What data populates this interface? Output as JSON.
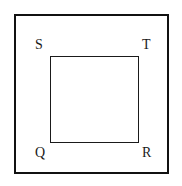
{
  "figure": {
    "type": "geometry-diagram",
    "background_color": "#ffffff",
    "stroke_color": "#111111",
    "outer_frame": {
      "name": "outer-rectangle",
      "x": 14,
      "y": 14,
      "width": 155,
      "height": 160,
      "stroke_width": 2
    },
    "inner_square": {
      "name": "square-QRTS",
      "x": 50,
      "y": 56,
      "width": 89,
      "height": 87,
      "stroke_width": 1.6
    },
    "vertices": [
      {
        "id": "S",
        "label": "S",
        "position": "top-left",
        "x": 35,
        "y": 38
      },
      {
        "id": "T",
        "label": "T",
        "position": "top-right",
        "x": 142,
        "y": 38
      },
      {
        "id": "Q",
        "label": "Q",
        "position": "bottom-left",
        "x": 35,
        "y": 146
      },
      {
        "id": "R",
        "label": "R",
        "position": "bottom-right",
        "x": 142,
        "y": 146
      }
    ]
  }
}
